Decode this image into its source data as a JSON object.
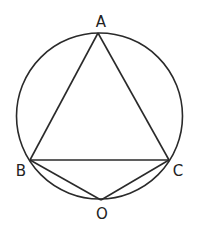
{
  "diagram": {
    "type": "geometry",
    "circle": {
      "cx": 99.5,
      "cy": 116,
      "r": 83
    },
    "points": {
      "A": {
        "label": "A",
        "x": 98,
        "y": 33,
        "lx": 101,
        "ly": 27
      },
      "B": {
        "label": "B",
        "x": 30,
        "y": 160,
        "lx": 21,
        "ly": 176
      },
      "C": {
        "label": "C",
        "x": 169,
        "y": 160,
        "lx": 178,
        "ly": 176
      },
      "O": {
        "label": "O",
        "x": 101,
        "y": 200,
        "lx": 102,
        "ly": 219
      }
    },
    "segments": [
      [
        "A",
        "B"
      ],
      [
        "A",
        "C"
      ],
      [
        "B",
        "C"
      ],
      [
        "B",
        "O"
      ],
      [
        "C",
        "O"
      ]
    ]
  }
}
